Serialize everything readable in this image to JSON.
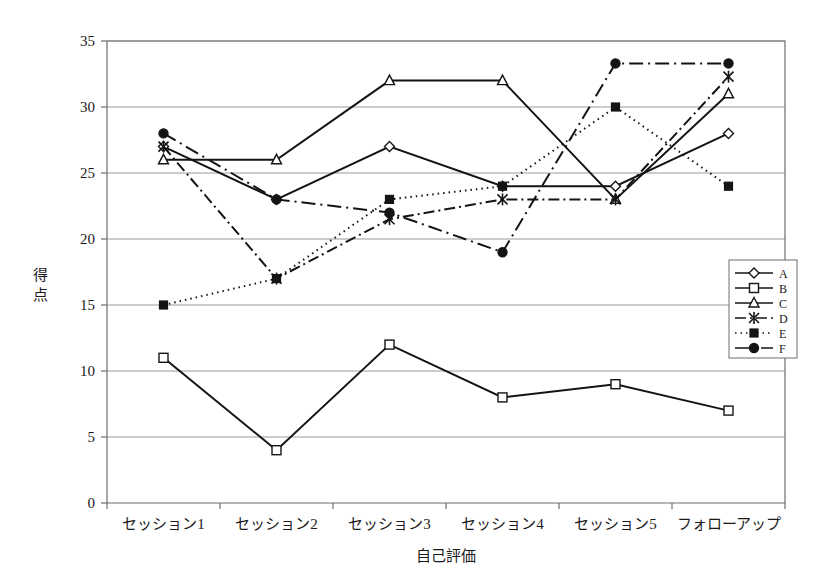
{
  "chart_data": {
    "type": "line",
    "title": "",
    "xlabel": "自己評価",
    "ylabel": "得点",
    "categories": [
      "セッション1",
      "セッション2",
      "セッション3",
      "セッション4",
      "セッション5",
      "フォローアップ"
    ],
    "ylim": [
      0,
      35
    ],
    "ytick_step": 5,
    "yticks": [
      "0",
      "5",
      "10",
      "15",
      "20",
      "25",
      "30",
      "35"
    ],
    "grid": true,
    "grid_axis": "y",
    "legend_position": "right-middle",
    "series": [
      {
        "name": "A",
        "values": [
          27,
          23,
          27,
          24,
          24,
          28
        ],
        "marker": "diamond-open",
        "line_style": "solid"
      },
      {
        "name": "B",
        "values": [
          11,
          4,
          12,
          8,
          9,
          7
        ],
        "marker": "square-open",
        "line_style": "solid"
      },
      {
        "name": "C",
        "values": [
          26,
          26,
          32,
          32,
          23,
          31
        ],
        "marker": "triangle-open",
        "line_style": "solid"
      },
      {
        "name": "D",
        "values": [
          27,
          17,
          21.5,
          23,
          23,
          32.3
        ],
        "marker": "cross-x",
        "line_style": "dash-dot"
      },
      {
        "name": "E",
        "values": [
          15,
          17,
          23,
          24,
          30,
          24
        ],
        "marker": "square-solid",
        "line_style": "dotted"
      },
      {
        "name": "F",
        "values": [
          28,
          23,
          22,
          19,
          33.3,
          33.3
        ],
        "marker": "circle-solid",
        "line_style": "dash-dot-long"
      }
    ]
  },
  "legend": {
    "entries": [
      {
        "label": "A"
      },
      {
        "label": "B"
      },
      {
        "label": "C"
      },
      {
        "label": "D"
      },
      {
        "label": "E"
      },
      {
        "label": "F"
      }
    ]
  }
}
